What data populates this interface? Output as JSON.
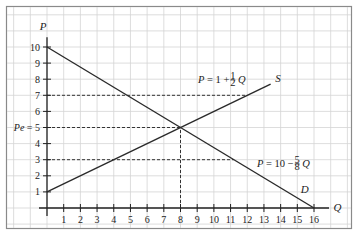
{
  "chart_data": {
    "type": "line",
    "title": "",
    "xlabel": "Q",
    "ylabel": "P",
    "xlim": [
      0,
      16
    ],
    "ylim": [
      0,
      10
    ],
    "x_ticks": [
      1,
      2,
      3,
      4,
      5,
      6,
      7,
      8,
      9,
      10,
      11,
      12,
      13,
      14,
      15,
      16
    ],
    "y_ticks": [
      1,
      2,
      3,
      4,
      5,
      6,
      7,
      8,
      9,
      10
    ],
    "y_tick_labels": [
      "1",
      "2",
      "3",
      "4",
      "Pe = 5",
      "6",
      "7",
      "8",
      "9",
      "10"
    ],
    "grid": true,
    "series": [
      {
        "name": "S",
        "equation": "P = 1 + 1/2 Q",
        "label_prefix": "P = 1 + ",
        "label_frac_num": "1",
        "label_frac_den": "2",
        "label_suffix": "Q",
        "points": [
          [
            0,
            1
          ],
          [
            13.4,
            7.7
          ]
        ]
      },
      {
        "name": "D",
        "equation": "P = 10 - 5/8 Q",
        "label_prefix": "P = 10 − ",
        "label_frac_num": "5",
        "label_frac_den": "8",
        "label_suffix": "Q",
        "points": [
          [
            0,
            10
          ],
          [
            16,
            0
          ]
        ]
      }
    ],
    "equilibrium": {
      "Q": 8,
      "P": 5,
      "label": "Pe"
    },
    "reference_lines": [
      {
        "type": "horizontal",
        "P": 7,
        "from_Q": 0,
        "to_Q": 12,
        "style": "dashed"
      },
      {
        "type": "horizontal",
        "P": 5,
        "from_Q": 0,
        "to_Q": 8,
        "style": "dashed"
      },
      {
        "type": "horizontal",
        "P": 3,
        "from_Q": 0,
        "to_Q": 11.2,
        "style": "dashed"
      },
      {
        "type": "vertical",
        "Q": 8,
        "from_P": 0,
        "to_P": 5,
        "style": "dashed"
      }
    ],
    "colors": {
      "line": "#2a2a2a",
      "grid": "#d4d4d4",
      "frame": "#8a8a8a",
      "background": "#ffffff"
    }
  }
}
